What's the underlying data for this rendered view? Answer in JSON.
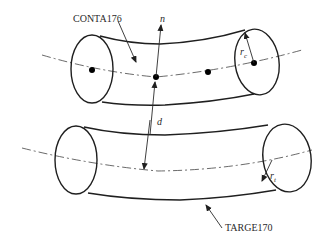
{
  "diagram": {
    "type": "contact-pair-schematic",
    "labels": {
      "contact_element": "CONTA176",
      "target_element": "TARGE170",
      "normal": "n",
      "distance": "d",
      "contact_radius_main": "r",
      "contact_radius_sub": "c",
      "target_radius_main": "r",
      "target_radius_sub": "t"
    },
    "components": [
      {
        "name": "contact-beam",
        "element": "CONTA176",
        "node_count": 4,
        "radius_symbol": "r_c"
      },
      {
        "name": "target-beam",
        "element": "TARGE170",
        "radius_symbol": "r_t"
      }
    ],
    "colors": {
      "line": "#1f1f1f",
      "background": "#ffffff"
    }
  }
}
